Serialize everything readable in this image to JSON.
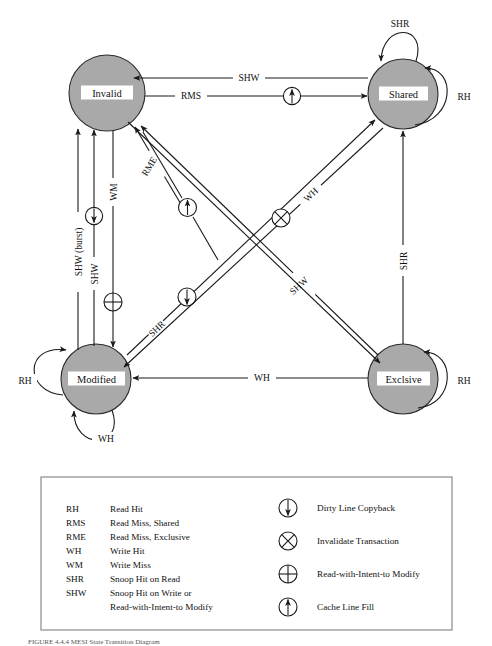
{
  "figure": {
    "type": "state-transition-diagram",
    "title_caption": "FIGURE 4.4.4  MESI State Transition Diagram",
    "colors": {
      "state_fill": "#a9a9a9",
      "state_stroke": "#2b2b2b",
      "line": "#1a1a1a",
      "label_background": "#ffffff",
      "legend_border": "#8a8a8a",
      "page_background": "#ffffff"
    }
  },
  "states": [
    {
      "id": "invalid",
      "label": "Invalid",
      "cx": 107,
      "cy": 93,
      "r": 38
    },
    {
      "id": "shared",
      "label": "Shared",
      "cx": 403,
      "cy": 94,
      "r": 35
    },
    {
      "id": "modified",
      "label": "Modified",
      "cx": 96,
      "cy": 379,
      "r": 35
    },
    {
      "id": "exclusive",
      "label": "Exclsive",
      "cx": 403,
      "cy": 379,
      "r": 35
    }
  ],
  "transitions": [
    {
      "id": "shared-to-invalid",
      "label": "SHW",
      "from": "shared",
      "to": "invalid",
      "symbol": "none"
    },
    {
      "id": "invalid-to-shared",
      "label": "RMS",
      "from": "invalid",
      "to": "shared",
      "symbol": "cache-line-fill"
    },
    {
      "id": "shared-self-shr",
      "label": "SHR",
      "from": "shared",
      "to": "shared",
      "symbol": "none"
    },
    {
      "id": "shared-self-rh",
      "label": "RH",
      "from": "shared",
      "to": "shared",
      "symbol": "none"
    },
    {
      "id": "modified-to-invalid-burst",
      "label": "SHW (burst)",
      "from": "modified",
      "to": "invalid",
      "symbol": "none"
    },
    {
      "id": "modified-to-invalid-shw",
      "label": "SHW",
      "from": "modified",
      "to": "invalid",
      "symbol": "dirty-line-copyback"
    },
    {
      "id": "invalid-to-modified-wm",
      "label": "WM",
      "from": "invalid",
      "to": "modified",
      "symbol": "read-with-intent-to-modify"
    },
    {
      "id": "modified-to-invalid-rme",
      "label": "RME",
      "from": "modified",
      "to": "invalid",
      "symbol": "none"
    },
    {
      "id": "invalid-to-exclusive-rme",
      "label": "",
      "from": "invalid",
      "to": "exclusive",
      "symbol": "cache-line-fill"
    },
    {
      "id": "modified-to-shared-shr",
      "label": "SHR",
      "from": "modified",
      "to": "shared",
      "symbol": "dirty-line-copyback"
    },
    {
      "id": "shared-to-modified-wh",
      "label": "WH",
      "from": "shared",
      "to": "modified",
      "symbol": "invalidate-transaction"
    },
    {
      "id": "exclusive-to-invalid-shw",
      "label": "SHW",
      "from": "exclusive",
      "to": "invalid",
      "symbol": "none"
    },
    {
      "id": "exclusive-to-shared-shr",
      "label": "SHR",
      "from": "exclusive",
      "to": "shared",
      "symbol": "none"
    },
    {
      "id": "exclusive-to-modified-wh",
      "label": "WH",
      "from": "exclusive",
      "to": "modified",
      "symbol": "none"
    },
    {
      "id": "modified-self-rh",
      "label": "RH",
      "from": "modified",
      "to": "modified",
      "symbol": "none"
    },
    {
      "id": "modified-self-wh",
      "label": "WH",
      "from": "modified",
      "to": "modified",
      "symbol": "none"
    },
    {
      "id": "exclusive-self-rh",
      "label": "RH",
      "from": "exclusive",
      "to": "exclusive",
      "symbol": "none"
    }
  ],
  "edge_labels": {
    "shw_top": "SHW",
    "rms_top": "RMS",
    "shr_shared_loop": "SHR",
    "rh_shared_loop": "RH",
    "shw_burst": "SHW (burst)",
    "shw_left": "SHW",
    "wm_left": "WM",
    "rme_diag": "RME",
    "wh_diag": "WH",
    "shr_diag": "SHR",
    "shw_diag": "SHW",
    "shr_right": "SHR",
    "wh_bottom": "WH",
    "rh_modified": "RH",
    "wh_modified_loop": "WH",
    "rh_exclusive": "RH"
  },
  "legend": {
    "abbreviations": [
      {
        "abbr": "RH",
        "meaning": "Read Hit"
      },
      {
        "abbr": "RMS",
        "meaning": "Read Miss, Shared"
      },
      {
        "abbr": "RME",
        "meaning": "Read Miss, Exclusive"
      },
      {
        "abbr": "WH",
        "meaning": "Write Hit"
      },
      {
        "abbr": "WM",
        "meaning": "Write Miss"
      },
      {
        "abbr": "SHR",
        "meaning": "Snoop Hit on Read"
      },
      {
        "abbr": "SHW",
        "meaning": "Snoop Hit on Write or"
      },
      {
        "abbr": "",
        "meaning": "Read-with-Intent-to Modify"
      }
    ],
    "symbols": [
      {
        "id": "dirty-line-copyback",
        "glyph": "circle-down-arrow",
        "label": "Dirty Line Copyback"
      },
      {
        "id": "invalidate-transaction",
        "glyph": "circle-cross",
        "label": "Invalidate Transaction"
      },
      {
        "id": "read-with-intent-to-modify",
        "glyph": "circle-plus",
        "label": "Read-with-Intent-to Modify"
      },
      {
        "id": "cache-line-fill",
        "glyph": "circle-up-arrow",
        "label": "Cache Line Fill"
      }
    ]
  }
}
